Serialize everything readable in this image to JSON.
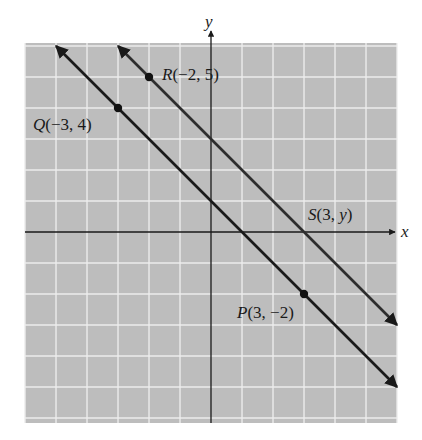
{
  "chart_data": {
    "type": "line",
    "title": "",
    "xlabel": "x",
    "ylabel": "y",
    "xlim": [
      -6,
      6
    ],
    "ylim": [
      -6,
      6
    ],
    "grid": true,
    "grid_step": 1,
    "legend": null,
    "series": [
      {
        "name": "Line QP",
        "equation": "y = -x + 1",
        "slope": -1,
        "intercept": 1,
        "x_range": [
          -5,
          6
        ],
        "color": "#1a1a1a"
      },
      {
        "name": "Line RS",
        "equation": "y = -x + 3",
        "slope": -1,
        "intercept": 3,
        "x_range": [
          -3,
          6
        ],
        "color": "#2e2e2e"
      }
    ],
    "points": [
      {
        "name": "R",
        "label": "R(−2, 5)",
        "x": -2,
        "y": 5,
        "marked": true
      },
      {
        "name": "Q",
        "label": "Q(−3, 4)",
        "x": -3,
        "y": 4,
        "marked": true
      },
      {
        "name": "P",
        "label": "P(3, −2)",
        "x": 3,
        "y": -2,
        "marked": true
      },
      {
        "name": "S",
        "label": "S(3, y)",
        "x": 3,
        "y": 0,
        "marked": false
      }
    ],
    "annotations": [
      "R(−2, 5)",
      "Q(−3, 4)",
      "P(3, −2)",
      "S(3, y)"
    ]
  },
  "labels": {
    "x_axis": "x",
    "y_axis": "y",
    "R": {
      "letter": "R",
      "coords": "(−2, 5)"
    },
    "Q": {
      "letter": "Q",
      "coords": "(−3, 4)"
    },
    "P": {
      "letter": "P",
      "coords": "(3, −2)"
    },
    "S": {
      "letter": "S",
      "coords_open": "(3, ",
      "coords_var": "y",
      "coords_close": ")"
    }
  },
  "colors": {
    "grid_bg": "#bdbdbd",
    "grid_line": "#ececec",
    "axis": "#1a1a1a",
    "line": "#1a1a1a"
  }
}
